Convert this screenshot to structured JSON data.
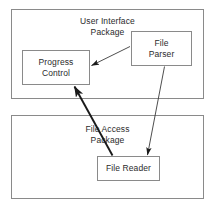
{
  "diagram": {
    "background_color": "#ffffff",
    "border_color": "#8a8a8a",
    "edge_color": "#1a1a1a",
    "text_color": "#2b2b2b",
    "packages": [
      {
        "id": "user-interface",
        "label": "User Interface\nPackage",
        "label_line1": "User Interface",
        "label_line2": "Package"
      },
      {
        "id": "file-access",
        "label": "File Access\nPackage",
        "label_line1": "File Access",
        "label_line2": "Package"
      }
    ],
    "nodes": [
      {
        "id": "progress-control",
        "label": "Progress\nControl",
        "label_line1": "Progress",
        "label_line2": "Control",
        "package": "user-interface"
      },
      {
        "id": "file-parser",
        "label": "File\nParser",
        "label_line1": "File",
        "label_line2": "Parser",
        "package": "user-interface"
      },
      {
        "id": "file-reader",
        "label": "File Reader",
        "label_line1": "File Reader",
        "label_line2": "",
        "package": "file-access"
      }
    ],
    "edges": [
      {
        "id": "file-parser-to-progress-control",
        "from": "file-parser",
        "to": "progress-control",
        "style": "thin-solid-filled-arrow"
      },
      {
        "id": "file-parser-to-file-reader",
        "from": "file-parser",
        "to": "file-reader",
        "style": "thin-solid-filled-arrow"
      },
      {
        "id": "file-reader-to-progress-control",
        "from": "file-reader",
        "to": "progress-control",
        "style": "thick-solid-filled-arrow"
      }
    ]
  }
}
